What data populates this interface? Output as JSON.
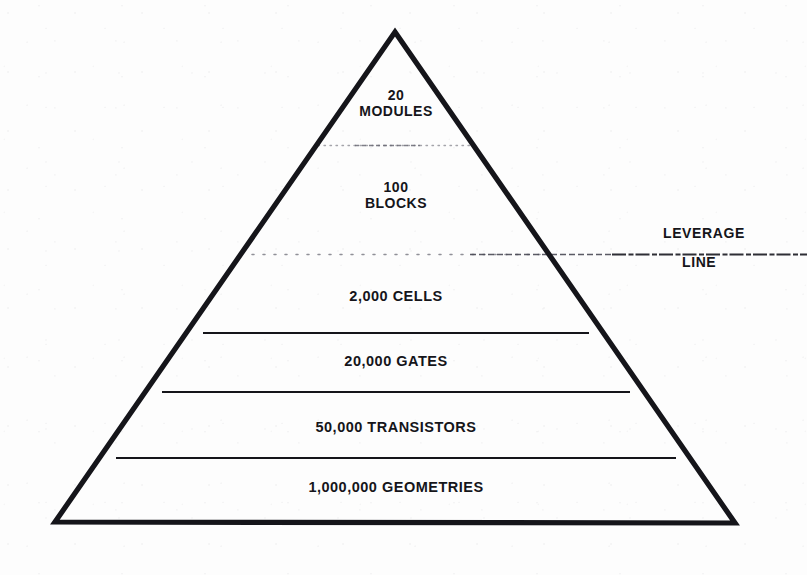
{
  "figure": {
    "type": "pyramid-diagram",
    "stroke_color": "#15151a",
    "background_color": "#fdfdfd",
    "apex": {
      "x": 395,
      "y": 32
    },
    "base_left": {
      "x": 55,
      "y": 522
    },
    "base_right": {
      "x": 735,
      "y": 523
    },
    "tiers": [
      {
        "id": "modules",
        "line_1": "20",
        "line_2": "MODULES",
        "count": "20",
        "unit": "MODULES",
        "divider_y": 145,
        "divider_style": "dotted-faint"
      },
      {
        "id": "blocks",
        "line_1": "100",
        "line_2": "BLOCKS",
        "count": "100",
        "unit": "BLOCKS",
        "divider_y": 254,
        "divider_style": "dotted-leverage"
      },
      {
        "id": "cells",
        "line_1": "2,000 CELLS",
        "line_2": "",
        "count": "2,000",
        "unit": "CELLS",
        "divider_y": 333,
        "divider_style": "solid"
      },
      {
        "id": "gates",
        "line_1": "20,000 GATES",
        "line_2": "",
        "count": "20,000",
        "unit": "GATES",
        "divider_y": 392,
        "divider_style": "solid"
      },
      {
        "id": "transistors",
        "line_1": "50,000 TRANSISTORS",
        "line_2": "",
        "count": "50,000",
        "unit": "TRANSISTORS",
        "divider_y": 458,
        "divider_style": "solid"
      },
      {
        "id": "geometries",
        "line_1": "1,000,000 GEOMETRIES",
        "line_2": "",
        "count": "1,000,000",
        "unit": "GEOMETRIES",
        "divider_y": null,
        "divider_style": "none"
      }
    ],
    "annotation": {
      "id": "leverage-line",
      "word_1": "LEVERAGE",
      "word_2": "LINE",
      "marker_y": 254,
      "marker_style": "dotted",
      "marker_extends_right_to_edge": true
    }
  }
}
